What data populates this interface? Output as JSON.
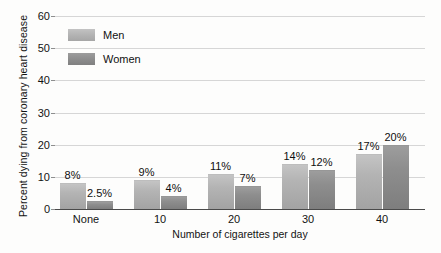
{
  "chart_data": {
    "type": "bar",
    "title": "",
    "subtitle": "",
    "xlabel": "Number of cigarettes per day",
    "ylabel": "Percent dying from coronary heart disease",
    "categories": [
      "None",
      "10",
      "20",
      "30",
      "40"
    ],
    "series": [
      {
        "name": "Men",
        "color": "#b3b3b3",
        "values": [
          8,
          9,
          11,
          14,
          17
        ],
        "labels": [
          "8%",
          "9%",
          "11%",
          "14%",
          "17%"
        ]
      },
      {
        "name": "Women",
        "color": "#8d8d8d",
        "values": [
          2.5,
          4,
          7,
          12,
          20
        ],
        "labels": [
          "2.5%",
          "4%",
          "7%",
          "12%",
          "20%"
        ]
      }
    ],
    "ylim": [
      0,
      60
    ],
    "yticks": [
      0,
      10,
      20,
      30,
      40,
      50,
      60
    ],
    "ytick_labels": [
      "0",
      "10",
      "20",
      "30",
      "40",
      "50",
      "60"
    ],
    "grid": true,
    "grid_axis": "y",
    "legend_position": "top-left",
    "background_color": "#fdfdfc",
    "gridline_color": "#d6d6d6",
    "axis_color": "#4a4a4a"
  },
  "legend": {
    "items": [
      {
        "label": "Men"
      },
      {
        "label": "Women"
      }
    ]
  }
}
